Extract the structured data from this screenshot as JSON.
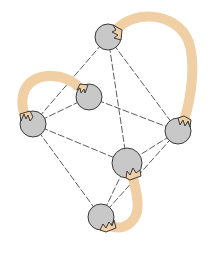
{
  "diagram": {
    "type": "graph",
    "colors": {
      "background": "#ffffff",
      "node_fill": "#c8c8c8",
      "node_stroke": "#3a3a3a",
      "edge_stroke": "#4a4a4a",
      "band": "#f0cfa5"
    },
    "nodes": [
      {
        "id": "top",
        "cx": 108,
        "cy": 37,
        "r": 13
      },
      {
        "id": "mid-left",
        "cx": 89,
        "cy": 97,
        "r": 13
      },
      {
        "id": "left",
        "cx": 33,
        "cy": 124,
        "r": 13
      },
      {
        "id": "right",
        "cx": 178,
        "cy": 131,
        "r": 13
      },
      {
        "id": "center",
        "cx": 127,
        "cy": 163,
        "r": 15
      },
      {
        "id": "bottom",
        "cx": 101,
        "cy": 217,
        "r": 13
      }
    ],
    "edges": [
      {
        "from": "top",
        "to": "left"
      },
      {
        "from": "top",
        "to": "center"
      },
      {
        "from": "top",
        "to": "right"
      },
      {
        "from": "left",
        "to": "mid-left"
      },
      {
        "from": "mid-left",
        "to": "right"
      },
      {
        "from": "left",
        "to": "center"
      },
      {
        "from": "left",
        "to": "bottom"
      },
      {
        "from": "right",
        "to": "center"
      },
      {
        "from": "right",
        "to": "bottom"
      },
      {
        "from": "center",
        "to": "bottom"
      }
    ],
    "bands": [
      {
        "id": "band-top-right",
        "from": "top",
        "to": "right"
      },
      {
        "id": "band-left-midleft",
        "from": "left",
        "to": "mid-left"
      },
      {
        "id": "band-center-bottom",
        "from": "center",
        "to": "bottom"
      }
    ]
  }
}
